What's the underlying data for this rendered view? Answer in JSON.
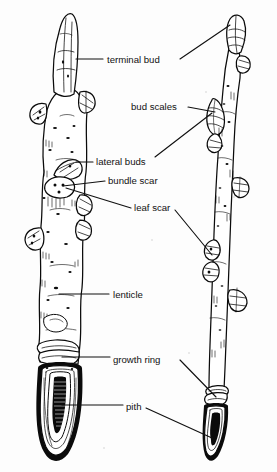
{
  "figure": {
    "style": "black and white scanned botanical illustration",
    "background_color": "#fdfdfd",
    "ink_color": "#0b0b0b",
    "subjects": [
      {
        "name": "left-twig",
        "description": "thick twig shown in detail with longitudinal cut revealing pith"
      },
      {
        "name": "right-twig",
        "description": "slender twig with alternating scaly lateral buds"
      }
    ],
    "labels": [
      {
        "id": "terminal-bud",
        "text": "terminal bud",
        "x": 107,
        "y": 63,
        "points_to": [
          "left-twig",
          "right-twig"
        ]
      },
      {
        "id": "bud-scales",
        "text": "bud scales",
        "x": 131,
        "y": 110,
        "points_to": [
          "right-twig"
        ]
      },
      {
        "id": "lateral-buds",
        "text": "lateral buds",
        "x": 96,
        "y": 165,
        "points_to": [
          "left-twig",
          "right-twig"
        ]
      },
      {
        "id": "bundle-scar",
        "text": "bundle scar",
        "x": 108,
        "y": 184,
        "points_to": [
          "left-twig"
        ]
      },
      {
        "id": "leaf-scar",
        "text": "leaf scar",
        "x": 134,
        "y": 211,
        "points_to": [
          "left-twig",
          "right-twig"
        ]
      },
      {
        "id": "lenticle",
        "text": "lenticle",
        "x": 113,
        "y": 298,
        "points_to": [
          "left-twig"
        ]
      },
      {
        "id": "growth-ring",
        "text": "growth ring",
        "x": 113,
        "y": 363,
        "points_to": [
          "left-twig",
          "right-twig"
        ]
      },
      {
        "id": "pith",
        "text": "pith",
        "x": 126,
        "y": 410,
        "points_to": [
          "left-twig",
          "right-twig"
        ]
      }
    ]
  }
}
